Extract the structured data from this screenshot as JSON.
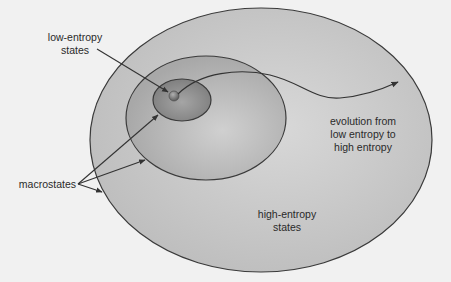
{
  "diagram": {
    "type": "nested-ellipses",
    "colors": {
      "background": "#f1f1f1",
      "outer_fill": "#c8c8c8",
      "middle_fill": "#b6b6b6",
      "inner_fill": "#8e8e8e",
      "ball_fill": "#6e6e6e",
      "stroke": "#3a3a3a"
    },
    "regions": [
      {
        "id": "high-entropy",
        "label": "high-entropy states"
      },
      {
        "id": "mid-entropy",
        "label": ""
      },
      {
        "id": "low-entropy",
        "label": "low-entropy states"
      }
    ],
    "labels": {
      "low_entropy_line1": "low-entropy",
      "low_entropy_line2": "states",
      "macrostates": "macrostates",
      "evolution_line1": "evolution from",
      "evolution_line2": "low entropy to",
      "evolution_line3": "high entropy",
      "high_entropy_line1": "high-entropy",
      "high_entropy_line2": "states"
    },
    "arrows": [
      {
        "from": "low-entropy states label",
        "to": "low-entropy ball"
      },
      {
        "from": "macrostates label",
        "to": "inner ellipse"
      },
      {
        "from": "macrostates label",
        "to": "middle ellipse"
      },
      {
        "from": "macrostates label",
        "to": "outer ellipse"
      },
      {
        "from": "low-entropy ball",
        "to": "high-entropy region",
        "label": "evolution from low entropy to high entropy"
      }
    ]
  }
}
